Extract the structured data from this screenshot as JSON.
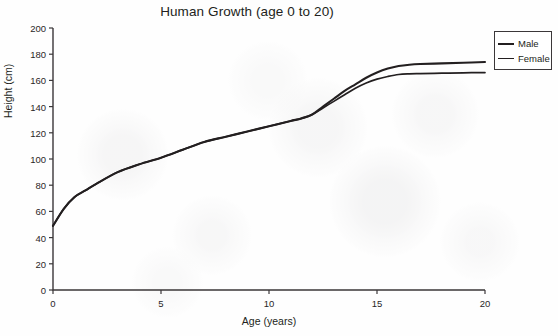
{
  "chart_data": {
    "type": "line",
    "title": "Human Growth (age 0 to 20)",
    "xlabel": "Age (years)",
    "ylabel": "Height (cm)",
    "xlim": [
      0,
      20
    ],
    "ylim": [
      0,
      200
    ],
    "xticks": [
      0,
      5,
      10,
      15,
      20
    ],
    "yticks": [
      0,
      20,
      40,
      60,
      80,
      100,
      120,
      140,
      160,
      180,
      200
    ],
    "grid": false,
    "legend_position": "outside-top-right",
    "line_color": "#231f20",
    "x": [
      0,
      0.5,
      1,
      1.5,
      2,
      3,
      4,
      5,
      6,
      7,
      8,
      9,
      10,
      11,
      11.5,
      12,
      12.5,
      13,
      13.5,
      14,
      14.5,
      15,
      15.5,
      16,
      16.5,
      17,
      18,
      19,
      20
    ],
    "series": [
      {
        "name": "Male",
        "values": [
          49,
          62,
          71,
          76,
          81,
          90,
          96,
          101,
          107,
          113,
          117,
          121,
          125,
          129,
          131,
          134,
          140,
          146,
          152,
          157,
          162,
          166,
          169,
          171,
          172,
          172.5,
          173,
          173.5,
          174
        ]
      },
      {
        "name": "Female",
        "values": [
          49,
          62,
          71,
          76,
          81,
          90,
          96,
          101,
          107,
          113,
          117,
          121,
          125,
          129,
          131,
          134,
          139,
          144,
          149,
          154,
          158,
          161,
          163,
          164.5,
          165,
          165.2,
          165.5,
          165.8,
          166
        ]
      }
    ]
  },
  "axes": {
    "y_tick_labels": [
      "200",
      "180",
      "160",
      "140",
      "120",
      "100",
      "80",
      "60",
      "40",
      "20",
      "0"
    ],
    "x_tick_labels": [
      "0",
      "5",
      "10",
      "15",
      "20"
    ],
    "y_title": "Height (cm)",
    "x_title": "Age (years)"
  },
  "legend": {
    "items": [
      {
        "label": "Male"
      },
      {
        "label": "Female"
      }
    ]
  }
}
